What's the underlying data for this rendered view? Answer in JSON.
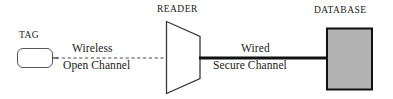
{
  "diagram": {
    "width": 393,
    "height": 99,
    "background": "#ffffff",
    "nodes": {
      "tag": {
        "label": "TAG",
        "shape": "rounded-rectangle",
        "fill": "#ffffff",
        "stroke": "#55555c"
      },
      "reader": {
        "label": "READER",
        "shape": "trapezoid",
        "fill": "#ffffff",
        "stroke": "#3a3a3a"
      },
      "database": {
        "label": "DATABASE",
        "shape": "rectangle",
        "fill": "#b3b3b3",
        "stroke": "#111111"
      }
    },
    "links": {
      "wireless": {
        "label_top": "Wireless",
        "label_bottom": "Open Channel",
        "style": "dashed",
        "color": "#4a4a4a"
      },
      "wired": {
        "label_top": "Wired",
        "label_bottom": "Secure Channel",
        "style": "solid",
        "color": "#111111"
      }
    }
  }
}
